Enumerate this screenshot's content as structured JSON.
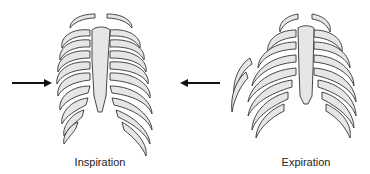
{
  "figure": {
    "panels": [
      {
        "id": "inspiration",
        "label": "Inspiration",
        "arrow_direction": "right"
      },
      {
        "id": "expiration",
        "label": "Expiration",
        "arrow_direction": "left"
      }
    ]
  },
  "colors": {
    "bone_fill": "#e6e6e6",
    "outline": "#333333",
    "arrow": "#111111",
    "background": "#ffffff"
  },
  "icons": {
    "left_arrow": "arrow-right-icon",
    "right_arrow": "arrow-left-icon"
  }
}
